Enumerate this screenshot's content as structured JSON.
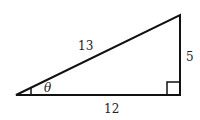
{
  "figure": {
    "type": "right-triangle",
    "vertices": {
      "left": [
        16,
        95
      ],
      "right_angle": [
        180,
        95
      ],
      "apex": [
        180,
        15
      ]
    },
    "labels": {
      "hypotenuse": "13",
      "opposite": "5",
      "adjacent": "12",
      "angle": "θ"
    },
    "stroke_color": "#111111"
  }
}
